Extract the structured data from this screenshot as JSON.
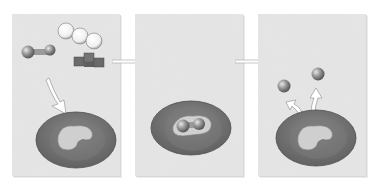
{
  "figure": {
    "panels": [
      {
        "id": "panel-1",
        "step": "substrate-approach",
        "elements": [
          "dumbbell-substrate",
          "hexagon-chain-molecule",
          "cube-cluster-molecule",
          "curved-arrow-to-enzyme",
          "enzyme"
        ]
      },
      {
        "id": "panel-2",
        "step": "enzyme-substrate-complex",
        "elements": [
          "enzyme",
          "bound-substrate"
        ]
      },
      {
        "id": "panel-3",
        "step": "product-release",
        "elements": [
          "enzyme",
          "product-sphere-left",
          "product-sphere-right",
          "release-arrow-left",
          "release-arrow-right"
        ]
      }
    ],
    "colors": {
      "background_texture": "#cfcfcf",
      "enzyme_outer": "#6e6e6e",
      "enzyme_inner": "#8a8a8a",
      "active_site": "#d4d4d4",
      "sphere": "#8c8c8c",
      "arrow": "#ffffff",
      "panel_shadow": "#d8d8d8"
    }
  }
}
